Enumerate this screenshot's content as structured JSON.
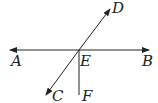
{
  "diagram": {
    "type": "geometry",
    "points": {
      "A": {
        "label": "A",
        "x": 14,
        "y": 64
      },
      "B": {
        "label": "B",
        "x": 144,
        "y": 64
      },
      "C": {
        "label": "C",
        "x": 54,
        "y": 101
      },
      "D": {
        "label": "D",
        "x": 113,
        "y": 12
      },
      "E": {
        "label": "E",
        "x": 81,
        "y": 64
      },
      "F": {
        "label": "F",
        "x": 82,
        "y": 101
      }
    },
    "lines": [
      {
        "name": "line-AB",
        "from": "A",
        "to": "B",
        "arrows": "both"
      },
      {
        "name": "line-CD",
        "from": "C",
        "to": "D",
        "arrows": "both"
      },
      {
        "name": "ray-EF",
        "from": "E",
        "to": "F",
        "arrows": "none"
      }
    ],
    "stroke_color": "#222222"
  }
}
